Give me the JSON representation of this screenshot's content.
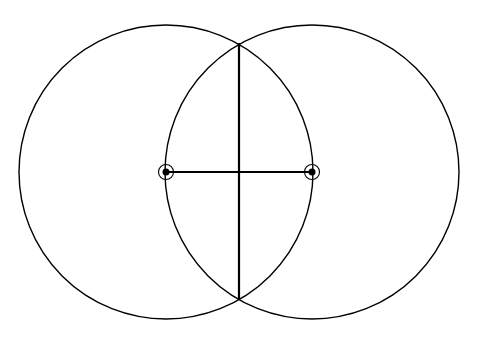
{
  "diagram": {
    "type": "geometric-construction",
    "background": "#ffffff",
    "stroke_color": "#000000",
    "circles": [
      {
        "name": "left-circle",
        "cx": 166,
        "cy": 172,
        "r": 147
      },
      {
        "name": "right-circle",
        "cx": 312,
        "cy": 172,
        "r": 147
      }
    ],
    "points": [
      {
        "name": "point-a",
        "x": 166,
        "y": 172
      },
      {
        "name": "point-b",
        "x": 312,
        "y": 172
      }
    ],
    "segments": [
      {
        "name": "segment-ab",
        "x1": 166,
        "y1": 172,
        "x2": 312,
        "y2": 172
      },
      {
        "name": "perpendicular-bisector",
        "x1": 239,
        "y1": 43,
        "x2": 239,
        "y2": 300
      }
    ]
  }
}
